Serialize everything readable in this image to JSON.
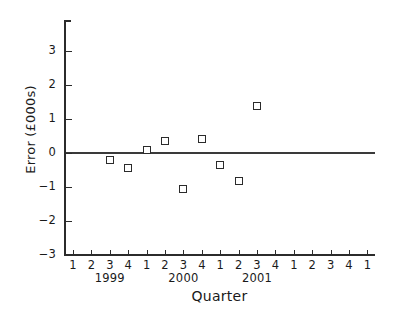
{
  "chart_data": {
    "type": "scatter",
    "title": "",
    "xlabel": "Quarter",
    "ylabel": "Error (£000s)",
    "ylim": [
      -3,
      3
    ],
    "yticks": [
      3,
      2,
      1,
      0,
      -1,
      -2,
      -3
    ],
    "ytick_labels": [
      "3",
      "2",
      "1",
      "0",
      "−1",
      "−2",
      "−3"
    ],
    "grid": false,
    "legend": null,
    "zero_reference_line": 0,
    "xtick_labels": [
      "1",
      "2",
      "3",
      "4",
      "1",
      "2",
      "3",
      "4",
      "1",
      "2",
      "3",
      "4",
      "1",
      "2",
      "3",
      "4",
      "1"
    ],
    "x_group_labels": [
      {
        "label": "1999",
        "center_index": 2
      },
      {
        "label": "2000",
        "center_index": 6
      },
      {
        "label": "2001",
        "center_index": 10
      }
    ],
    "points": [
      {
        "x_index": 2,
        "quarter": "3",
        "year": "1999",
        "value": -0.2
      },
      {
        "x_index": 3,
        "quarter": "4",
        "year": "1999",
        "value": -0.44
      },
      {
        "x_index": 4,
        "quarter": "1",
        "year": "2000",
        "value": 0.08
      },
      {
        "x_index": 5,
        "quarter": "2",
        "year": "2000",
        "value": 0.35
      },
      {
        "x_index": 6,
        "quarter": "3",
        "year": "2000",
        "value": -1.06
      },
      {
        "x_index": 7,
        "quarter": "4",
        "year": "2000",
        "value": 0.41
      },
      {
        "x_index": 8,
        "quarter": "1",
        "year": "2001",
        "value": -0.35
      },
      {
        "x_index": 9,
        "quarter": "2",
        "year": "2001",
        "value": -0.82
      },
      {
        "x_index": 10,
        "quarter": "3",
        "year": "2001",
        "value": 1.38
      }
    ],
    "colors": {
      "axis": "#2b2b2b",
      "marker_edge": "#2b2b2b",
      "marker_face": "#ffffff",
      "zero_line": "#3a3a3a",
      "background": "#ffffff"
    }
  },
  "geometry": {
    "plot_left": 64,
    "plot_right": 375,
    "plot_top": 20,
    "plot_bottom": 255,
    "y_zero_px": 153,
    "y_unit_px": 34,
    "x_first_tick_px": 73,
    "x_tick_step_px": 18.4
  }
}
